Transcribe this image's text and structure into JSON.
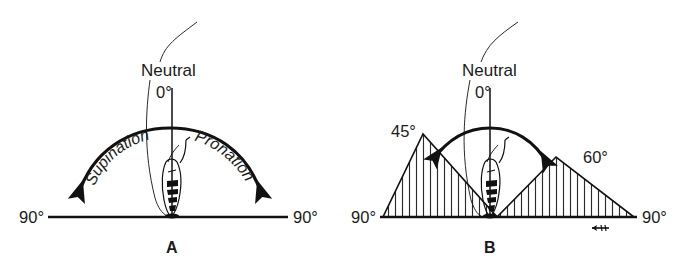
{
  "figure": {
    "background_color": "#ffffff",
    "ink_color": "#111111",
    "panels": [
      {
        "id": "A",
        "panel_label": "A",
        "neutral_label": "Neutral",
        "neutral_degrees": "0°",
        "left_limit": "90°",
        "right_limit": "90°",
        "motion_left": "Supination",
        "motion_right": "Pronation",
        "arc_style": "full-arc-with-arrowheads-both-ends"
      },
      {
        "id": "B",
        "panel_label": "B",
        "neutral_label": "Neutral",
        "neutral_degrees": "0°",
        "left_limit": "90°",
        "right_limit": "90°",
        "left_restricted": "45°",
        "right_restricted": "60°",
        "arc_style": "short-arc-with-arrowheads-both-ends",
        "shaded_regions": [
          {
            "side": "left",
            "label": "45°",
            "hatching": "vertical-lines"
          },
          {
            "side": "right",
            "label": "60°",
            "hatching": "vertical-lines"
          }
        ],
        "signature_mark": true
      }
    ]
  }
}
